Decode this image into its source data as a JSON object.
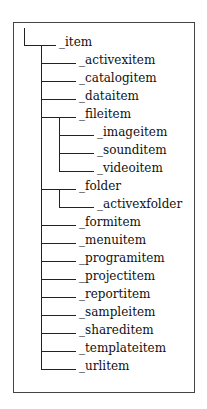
{
  "tree": {
    "root": {
      "label": "_item",
      "children": [
        {
          "label": "_activexitem"
        },
        {
          "label": "_catalogitem"
        },
        {
          "label": "_dataitem"
        },
        {
          "label": "_fileitem",
          "children": [
            {
              "label": "_imageitem"
            },
            {
              "label": "_sounditem"
            },
            {
              "label": "_videoitem"
            }
          ]
        },
        {
          "label": "_folder",
          "children": [
            {
              "label": "_activexfolder"
            }
          ]
        },
        {
          "label": "_formitem"
        },
        {
          "label": "_menuitem"
        },
        {
          "label": "_programitem"
        },
        {
          "label": "_projectitem"
        },
        {
          "label": "_reportitem"
        },
        {
          "label": "_sampleitem"
        },
        {
          "label": "_shareditem"
        },
        {
          "label": "_templateitem"
        },
        {
          "label": "_urlitem"
        }
      ]
    }
  },
  "colors": {
    "line": "#222222",
    "text": "#111111",
    "border": "#444444"
  }
}
